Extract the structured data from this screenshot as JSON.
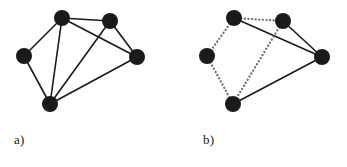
{
  "figure": {
    "background_color": "#ffffff",
    "node_color": "#1a1a1a",
    "solid_edge_color": "#1a1a1a",
    "dotted_edge_color": "#6e6e6e",
    "node_radius": 8,
    "solid_edge_width": 1.6,
    "dotted_edge_width": 2.2,
    "width": 347,
    "height": 167
  },
  "panels": [
    {
      "id": "panel-a",
      "label": "a)",
      "label_position": {
        "x": 14,
        "y": 132
      },
      "description": "undirected graph with five vertices and eight solid edges",
      "nodes": [
        {
          "id": "A",
          "x": 62,
          "y": 18
        },
        {
          "id": "B",
          "x": 110,
          "y": 21
        },
        {
          "id": "C",
          "x": 24,
          "y": 56
        },
        {
          "id": "D",
          "x": 137,
          "y": 57
        },
        {
          "id": "E",
          "x": 50,
          "y": 104
        }
      ],
      "edges": [
        {
          "from": "A",
          "to": "B",
          "style": "solid"
        },
        {
          "from": "A",
          "to": "C",
          "style": "solid"
        },
        {
          "from": "A",
          "to": "D",
          "style": "solid"
        },
        {
          "from": "A",
          "to": "E",
          "style": "solid"
        },
        {
          "from": "B",
          "to": "D",
          "style": "solid"
        },
        {
          "from": "B",
          "to": "E",
          "style": "solid"
        },
        {
          "from": "C",
          "to": "E",
          "style": "solid"
        },
        {
          "from": "D",
          "to": "E",
          "style": "solid"
        }
      ]
    },
    {
      "id": "panel-b",
      "label": "b)",
      "label_position": {
        "x": 203,
        "y": 132
      },
      "description": "same graph with five edges drawn dotted and three edges drawn solid",
      "nodes": [
        {
          "id": "A",
          "x": 234,
          "y": 18
        },
        {
          "id": "B",
          "x": 283,
          "y": 21
        },
        {
          "id": "C",
          "x": 207,
          "y": 56
        },
        {
          "id": "D",
          "x": 322,
          "y": 57
        },
        {
          "id": "E",
          "x": 233,
          "y": 104
        }
      ],
      "edges": [
        {
          "from": "A",
          "to": "B",
          "style": "dotted"
        },
        {
          "from": "A",
          "to": "C",
          "style": "dotted"
        },
        {
          "from": "A",
          "to": "D",
          "style": "solid"
        },
        {
          "from": "B",
          "to": "D",
          "style": "solid"
        },
        {
          "from": "B",
          "to": "E",
          "style": "dotted"
        },
        {
          "from": "C",
          "to": "E",
          "style": "dotted"
        },
        {
          "from": "D",
          "to": "E",
          "style": "solid"
        }
      ]
    }
  ]
}
